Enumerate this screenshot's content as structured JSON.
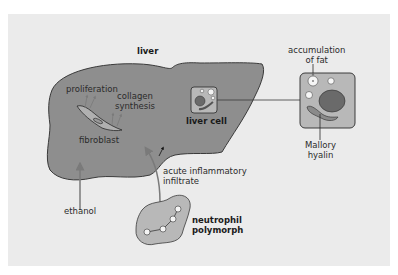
{
  "diagram": {
    "colors": {
      "background": "#ffffff",
      "panel": "#ebebeb",
      "liver_fill": "#8e8e8e",
      "liver_stroke": "#3a3a3a",
      "cell_fill": "#b8b8b8",
      "nucleus": "#6a6a6a",
      "arrow": "#7a7a7a",
      "text": "#2b2b2b"
    },
    "labels": {
      "liver": "liver",
      "proliferation": "proliferation",
      "collagen_line1": "collagen",
      "collagen_line2": "synthesis",
      "fibroblast": "fibroblast",
      "liver_cell": "liver cell",
      "accumulation_line1": "accumulation",
      "accumulation_line2": "of fat",
      "mallory_line1": "Mallory",
      "mallory_line2": "hyalin",
      "acute_line1": "acute inflammatory",
      "acute_line2": "infiltrate",
      "ethanol": "ethanol",
      "neutrophil_line1": "neutrophil",
      "neutrophil_line2": "polymorph"
    },
    "nodes": [
      {
        "id": "liver",
        "type": "organ"
      },
      {
        "id": "fibroblast",
        "type": "cell"
      },
      {
        "id": "liver-cell",
        "type": "cell"
      },
      {
        "id": "liver-cell-enlarged",
        "type": "cell-detail"
      },
      {
        "id": "neutrophil",
        "type": "cell"
      },
      {
        "id": "ethanol",
        "type": "agent"
      }
    ],
    "edges": [
      {
        "from": "ethanol",
        "to": "liver"
      },
      {
        "from": "neutrophil",
        "to": "liver",
        "label": "acute inflammatory infiltrate"
      },
      {
        "from": "fibroblast",
        "to": "proliferation"
      },
      {
        "from": "fibroblast",
        "to": "collagen synthesis"
      },
      {
        "from": "liver-cell",
        "to": "liver-cell-enlarged"
      }
    ]
  }
}
